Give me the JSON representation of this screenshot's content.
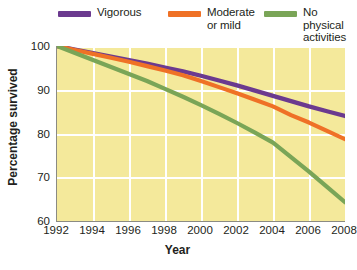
{
  "chart_data": {
    "type": "line",
    "title": "",
    "xlabel": "Year",
    "ylabel": "Percentage survived",
    "xlim": [
      1992,
      2008
    ],
    "ylim": [
      60,
      100
    ],
    "xticks": [
      1992,
      1994,
      1996,
      1998,
      2000,
      2002,
      2004,
      2006,
      2008
    ],
    "yticks": [
      60,
      70,
      80,
      90,
      100
    ],
    "grid": true,
    "legend_position": "top",
    "x": [
      1992,
      1993,
      1994,
      1995,
      1996,
      1997,
      1998,
      1999,
      2000,
      2001,
      2002,
      2003,
      2004,
      2005,
      2006,
      2007,
      2008
    ],
    "series": [
      {
        "name": "Vigorous",
        "color": "#6b3a8f",
        "values": [
          100,
          99.2,
          98.4,
          97.6,
          96.8,
          96.0,
          95.1,
          94.2,
          93.2,
          92.1,
          91.0,
          89.8,
          88.6,
          87.4,
          86.2,
          85.1,
          84.0
        ]
      },
      {
        "name": "Moderate or mild",
        "color": "#ef7126",
        "values": [
          100,
          99.1,
          98.2,
          97.3,
          96.4,
          95.4,
          94.4,
          93.3,
          92.0,
          90.6,
          89.2,
          87.7,
          86.2,
          84.2,
          82.5,
          80.6,
          78.7
        ]
      },
      {
        "name": "No physical activities",
        "color": "#7aa557",
        "values": [
          100,
          98.4,
          96.8,
          95.2,
          93.6,
          92.0,
          90.2,
          88.4,
          86.5,
          84.5,
          82.4,
          80.2,
          77.9,
          74.6,
          71.3,
          67.8,
          64.3
        ]
      }
    ]
  },
  "legend": {
    "items": [
      {
        "label": "Vigorous",
        "color": "#6b3a8f"
      },
      {
        "label": "Moderate\nor mild",
        "color": "#ef7126"
      },
      {
        "label": "No physical\nactivities",
        "color": "#7aa557"
      }
    ]
  },
  "colors": {
    "plot_background": "#f4e99b",
    "gridline": "#ffffff",
    "axis": "#8b8b83",
    "text": "#231f20",
    "page_background": "#ffffff"
  }
}
